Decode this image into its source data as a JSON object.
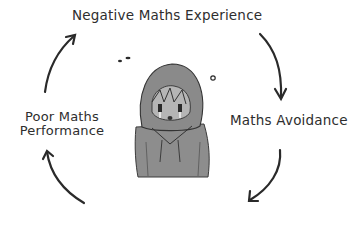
{
  "diagram": {
    "type": "cycle",
    "nodes": [
      {
        "id": "top",
        "label": "Negative Maths Experience"
      },
      {
        "id": "right",
        "label": "Maths Avoidance"
      },
      {
        "id": "bottom",
        "label": ""
      },
      {
        "id": "left",
        "label_line1": "Poor Maths",
        "label_line2": "Performance"
      }
    ],
    "center_illustration": "sad-child-in-hoodie",
    "stroke_color": "#2a2a2a",
    "fill_gray": "#8a8a8a"
  }
}
